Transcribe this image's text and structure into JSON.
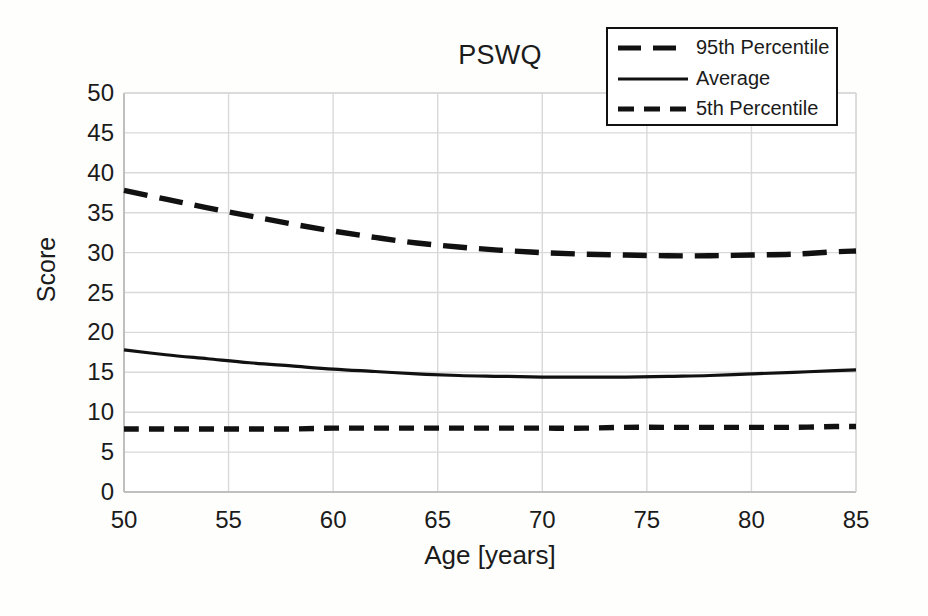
{
  "chart_data": {
    "type": "line",
    "title": "PSWQ",
    "xlabel": "Age [years]",
    "ylabel": "Score",
    "xlim": [
      50,
      85
    ],
    "ylim": [
      0,
      50
    ],
    "xticks": [
      50,
      55,
      60,
      65,
      70,
      75,
      80,
      85
    ],
    "yticks": [
      0,
      5,
      10,
      15,
      20,
      25,
      30,
      35,
      40,
      45,
      50
    ],
    "grid": true,
    "legend_position": "top-right",
    "x": [
      50,
      52,
      54,
      56,
      58,
      60,
      62,
      64,
      66,
      68,
      70,
      72,
      74,
      76,
      78,
      80,
      82,
      84,
      85
    ],
    "series": [
      {
        "name": "95th Percentile",
        "style": "dashed-long",
        "color": "#111111",
        "values": [
          37.8,
          36.7,
          35.6,
          34.6,
          33.6,
          32.7,
          31.9,
          31.2,
          30.7,
          30.3,
          30.0,
          29.8,
          29.7,
          29.6,
          29.6,
          29.7,
          29.8,
          30.1,
          30.2
        ]
      },
      {
        "name": "Average",
        "style": "solid",
        "color": "#111111",
        "values": [
          17.8,
          17.2,
          16.7,
          16.2,
          15.8,
          15.4,
          15.1,
          14.8,
          14.6,
          14.5,
          14.4,
          14.4,
          14.4,
          14.5,
          14.6,
          14.8,
          15.0,
          15.2,
          15.3
        ]
      },
      {
        "name": "5th Percentile",
        "style": "dashed-short",
        "color": "#111111",
        "values": [
          7.9,
          7.9,
          7.9,
          7.9,
          7.9,
          8.0,
          8.0,
          8.0,
          8.0,
          8.0,
          8.0,
          8.0,
          8.1,
          8.1,
          8.1,
          8.1,
          8.1,
          8.2,
          8.2
        ]
      }
    ]
  },
  "legend": {
    "items": [
      {
        "label": "95th Percentile",
        "swatch": "dashed-long"
      },
      {
        "label": "Average",
        "swatch": "solid"
      },
      {
        "label": "5th Percentile",
        "swatch": "dashed-short"
      }
    ]
  },
  "colors": {
    "line": "#111111",
    "grid": "#d9d9d9",
    "axis": "#bfbfbf",
    "background": "#fefefc",
    "text": "#1b1b1b"
  }
}
